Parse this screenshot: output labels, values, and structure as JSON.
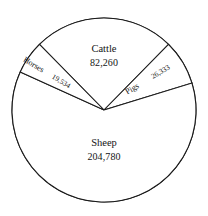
{
  "chart_data": {
    "type": "pie",
    "title": "",
    "subtitle": "",
    "xlabel": "",
    "ylabel": "",
    "legend_position": "none",
    "grid": false,
    "labels_inside": true,
    "total": 332907,
    "categories": [
      "Cattle",
      "Pigs",
      "Sheep",
      "Horses"
    ],
    "values": [
      82260,
      26333,
      204780,
      19534
    ],
    "value_labels": [
      "82,260",
      "26,333",
      "204,780",
      "19,534"
    ],
    "slices": [
      {
        "name": "Cattle",
        "label": "Cattle",
        "value": 82260,
        "value_label": "82,260",
        "percent": 24.7,
        "angle_deg": 88.96,
        "start_deg": 315.5,
        "end_deg": 44.5,
        "fill": "#ffffff",
        "stroke": "#1a1a1a",
        "label_rotation": 0
      },
      {
        "name": "Pigs",
        "label": "Pigs",
        "value": 26333,
        "value_label": "26,333",
        "percent": 7.9,
        "angle_deg": 28.48,
        "start_deg": 44.5,
        "end_deg": 72.98,
        "fill": "#ffffff",
        "stroke": "#1a1a1a",
        "label_rotation": -31
      },
      {
        "name": "Sheep",
        "label": "Sheep",
        "value": 204780,
        "value_label": "204,780",
        "percent": 61.5,
        "angle_deg": 221.44,
        "start_deg": 72.98,
        "end_deg": 294.42,
        "fill": "#ffffff",
        "stroke": "#1a1a1a",
        "label_rotation": 0
      },
      {
        "name": "Horses",
        "label": "Horses",
        "value": 19534,
        "value_label": "19,534",
        "percent": 5.9,
        "angle_deg": 21.12,
        "start_deg": 294.42,
        "end_deg": 315.5,
        "fill": "#ffffff",
        "stroke": "#1a1a1a",
        "label_rotation": 31
      }
    ],
    "geometry": {
      "center_x": 104,
      "center_y": 110,
      "radius": 92
    },
    "colors": {
      "background": "#ffffff",
      "stroke": "#1a1a1a",
      "text": "#141414"
    }
  }
}
